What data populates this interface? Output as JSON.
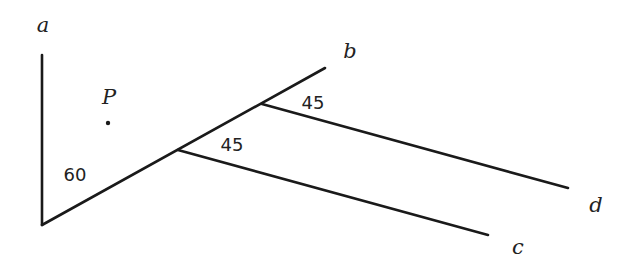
{
  "diagram": {
    "type": "geometry-lines-and-angles",
    "colors": {
      "stroke": "#1a1a1a",
      "text": "#222222",
      "background": "#ffffff"
    },
    "vertex": {
      "x": 42,
      "y": 225
    },
    "lines": {
      "a": {
        "label": "a",
        "from": [
          42,
          225
        ],
        "to": [
          42,
          55
        ],
        "label_pos": [
          43,
          32
        ]
      },
      "b": {
        "label": "b",
        "from": [
          42,
          225
        ],
        "to": [
          325,
          68
        ],
        "label_pos": [
          350,
          58
        ]
      },
      "c": {
        "label": "c",
        "from": [
          178,
          150
        ],
        "to": [
          488,
          235
        ],
        "label_pos": [
          518,
          254
        ]
      },
      "d": {
        "label": "d",
        "from": [
          262,
          104
        ],
        "to": [
          568,
          188
        ],
        "label_pos": [
          596,
          212
        ]
      }
    },
    "point_P": {
      "label": "P",
      "x": 108,
      "y": 123,
      "label_pos": [
        109,
        104
      ]
    },
    "angles": {
      "angle_ab": {
        "value": "60",
        "pos": [
          75,
          181
        ]
      },
      "angle_bc": {
        "value": "45",
        "pos": [
          232,
          151
        ]
      },
      "angle_bd": {
        "value": "45",
        "pos": [
          313,
          109
        ]
      }
    }
  }
}
